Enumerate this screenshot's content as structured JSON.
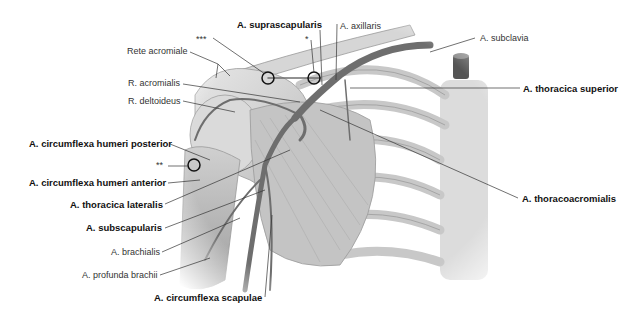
{
  "figure": {
    "type": "anatomical-illustration",
    "signature": "Moll"
  },
  "labels": {
    "suprascapularis": {
      "text": "A. suprascapularis",
      "bold": true
    },
    "axillaris": {
      "text": "A. axillaris",
      "bold": false
    },
    "subclavia": {
      "text": "A. subclavia",
      "bold": false
    },
    "thoracica_superior": {
      "text": "A. thoracica superior",
      "bold": true
    },
    "thoracoacromialis": {
      "text": "A. thoracoacromialis",
      "bold": true
    },
    "rete_acromiale": {
      "text": "Rete acromiale",
      "bold": false
    },
    "r_acromialis": {
      "text": "R. acromialis",
      "bold": false
    },
    "r_deltoideus": {
      "text": "R. deltoideus",
      "bold": false
    },
    "circ_hum_post": {
      "text": "A. circumflexa humeri posterior",
      "bold": true
    },
    "circ_hum_ant": {
      "text": "A. circumflexa humeri anterior",
      "bold": true
    },
    "thoracica_lateralis": {
      "text": "A. thoracica lateralis",
      "bold": true
    },
    "subscapularis": {
      "text": "A. subscapularis",
      "bold": true
    },
    "brachialis": {
      "text": "A. brachialis",
      "bold": false
    },
    "profunda_brachii": {
      "text": "A. profunda brachii",
      "bold": false
    },
    "circ_scapulae": {
      "text": "A. circumflexa scapulae",
      "bold": true
    },
    "marker_single": {
      "text": "*"
    },
    "marker_double": {
      "text": "**"
    },
    "marker_triple": {
      "text": "***"
    }
  },
  "colors": {
    "background": "#ffffff",
    "leader_line": "#333333",
    "illustration_light": "#d8d8d8",
    "illustration_mid": "#a8a8a8",
    "artery": "#6e6e6e"
  }
}
